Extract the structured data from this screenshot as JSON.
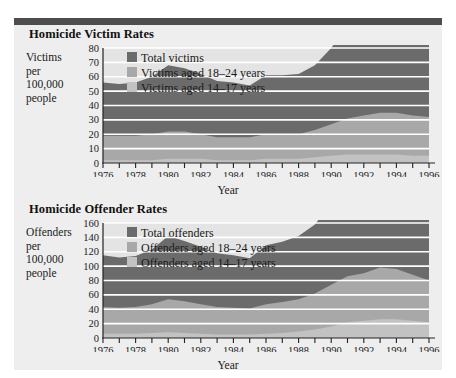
{
  "page": {
    "background_color": "#ffffff",
    "panel_color": "#eeeeee",
    "rule_color": "#4d4d4d"
  },
  "palette": {
    "total": "#6b6b6b",
    "aged_18_24": "#a8a8a8",
    "aged_14_17": "#c2c2c2",
    "gridline": "#ffffff",
    "axis": "#222222",
    "text": "#1a1a1a"
  },
  "charts": [
    {
      "title": "Homicide Victim Rates",
      "ylabel_lines": [
        "Victims",
        "per",
        "100,000",
        "people"
      ],
      "xlabel": "Year",
      "legend": [
        {
          "label": "Total victims",
          "color": "#6b6b6b"
        },
        {
          "label": "Victims aged 18–24 years",
          "color": "#a8a8a8"
        },
        {
          "label": "Victims aged 14–17 years",
          "color": "#c2c2c2"
        }
      ],
      "yticks": [
        "0",
        "10",
        "20",
        "30",
        "40",
        "50",
        "60",
        "70",
        "80"
      ],
      "xticks": [
        "1976",
        "1978",
        "1980",
        "1982",
        "1984",
        "1986",
        "1988",
        "1990",
        "1992",
        "1994",
        "1996"
      ]
    },
    {
      "title": "Homicide Offender Rates",
      "ylabel_lines": [
        "Offenders",
        "per",
        "100,000",
        "people"
      ],
      "xlabel": "Year",
      "legend": [
        {
          "label": "Total offenders",
          "color": "#6b6b6b"
        },
        {
          "label": "Offenders aged 18–24 years",
          "color": "#a8a8a8"
        },
        {
          "label": "Offenders aged 14–17 years",
          "color": "#c2c2c2"
        }
      ],
      "yticks": [
        "0",
        "20",
        "40",
        "60",
        "80",
        "100",
        "120",
        "140",
        "160"
      ],
      "xticks": [
        "1976",
        "1978",
        "1980",
        "1982",
        "1984",
        "1986",
        "1988",
        "1990",
        "1992",
        "1994",
        "1996"
      ]
    }
  ],
  "chart_data": [
    {
      "type": "area",
      "title": "Homicide Victim Rates",
      "xlabel": "Year",
      "ylabel": "Victims per 100,000 people",
      "grid": true,
      "legend_position": "inside-top-left",
      "x": [
        1976,
        1977,
        1978,
        1979,
        1980,
        1981,
        1982,
        1983,
        1984,
        1985,
        1986,
        1987,
        1988,
        1989,
        1990,
        1991,
        1992,
        1993,
        1994,
        1995,
        1996
      ],
      "xlim": [
        1976,
        1996
      ],
      "ylim": [
        0,
        80
      ],
      "stacked": true,
      "series": [
        {
          "name": "Victims aged 14–17 years",
          "color": "#c2c2c2",
          "values": [
            2,
            2,
            2,
            2,
            3,
            3,
            3,
            2,
            2,
            2,
            3,
            3,
            3,
            4,
            5,
            6,
            6,
            6,
            6,
            5,
            5
          ]
        },
        {
          "name": "Victims aged 18–24 years",
          "color": "#a8a8a8",
          "values": [
            17,
            17,
            17,
            18,
            19,
            19,
            17,
            16,
            16,
            16,
            17,
            17,
            17,
            19,
            22,
            25,
            27,
            29,
            29,
            28,
            27
          ]
        },
        {
          "name": "Total victims",
          "color": "#6b6b6b",
          "values": [
            37,
            36,
            37,
            40,
            46,
            44,
            42,
            39,
            38,
            36,
            41,
            41,
            42,
            45,
            53,
            65,
            69,
            73,
            72,
            66,
            60
          ]
        }
      ]
    },
    {
      "type": "area",
      "title": "Homicide Offender Rates",
      "xlabel": "Year",
      "ylabel": "Offenders per 100,000 people",
      "grid": true,
      "legend_position": "inside-top-left",
      "x": [
        1976,
        1977,
        1978,
        1979,
        1980,
        1981,
        1982,
        1983,
        1984,
        1985,
        1986,
        1987,
        1988,
        1989,
        1990,
        1991,
        1992,
        1993,
        1994,
        1995,
        1996
      ],
      "xlim": [
        1976,
        1996
      ],
      "ylim": [
        0,
        160
      ],
      "stacked": true,
      "series": [
        {
          "name": "Offenders aged 14–17 years",
          "color": "#c2c2c2",
          "values": [
            6,
            6,
            6,
            7,
            8,
            7,
            6,
            5,
            5,
            5,
            6,
            7,
            9,
            12,
            16,
            22,
            24,
            26,
            26,
            24,
            22
          ]
        },
        {
          "name": "Offenders aged 18–24 years",
          "color": "#a8a8a8",
          "values": [
            37,
            36,
            37,
            40,
            46,
            44,
            41,
            38,
            37,
            36,
            41,
            43,
            45,
            50,
            58,
            64,
            66,
            72,
            70,
            64,
            58
          ]
        },
        {
          "name": "Total offenders",
          "color": "#6b6b6b",
          "values": [
            72,
            70,
            71,
            76,
            88,
            84,
            80,
            75,
            73,
            70,
            82,
            84,
            88,
            96,
            114,
            136,
            138,
            148,
            144,
            130,
            118
          ]
        }
      ]
    }
  ]
}
